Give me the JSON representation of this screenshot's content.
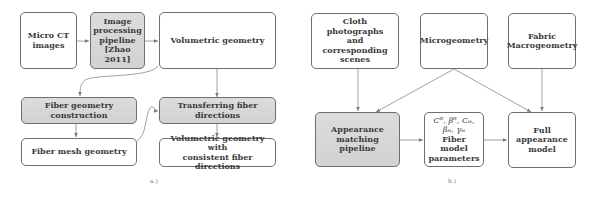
{
  "panel_a": {
    "label": "a.)",
    "boxes": {
      "micro_ct": "Micro CT\nimages",
      "image_processing": "Image\nprocessing\npipeline\n[Zhao 2011]",
      "volumetric": "Volumetric geometry",
      "fiber_construction": "Fiber geometry construction",
      "transferring": "Transferring fiber directions",
      "fiber_mesh": "Fiber mesh geometry",
      "volumetric_consistent": "Volumetric geometry with\nconsistent fiber directions"
    }
  },
  "panel_b": {
    "label": "b.)",
    "boxes": {
      "cloth_photos": "Cloth photographs\nand corresponding\nscenes",
      "microgeometry": "Microgeometry",
      "fabric_macro": "Fabric\nMacrogeometry",
      "appearance_matching": "Appearance\nmatching pipeline",
      "params_symbols_1": "Cᴿ, βᴿ, Cₜₜ,",
      "params_symbols_2": "βₜₜ, γₜₜ",
      "params_title": "Fiber model\nparameters",
      "full_appearance": "Full appearance\nmodel"
    }
  },
  "colors": {
    "shaded_fill": "#d6d6d6",
    "border": "#6e6e6e",
    "arrow": "#777777"
  }
}
